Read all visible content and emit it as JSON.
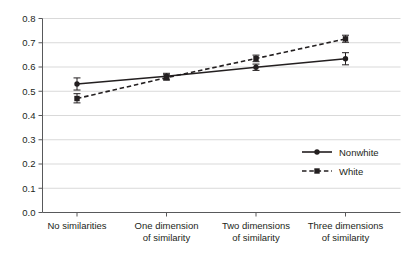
{
  "chart_data": {
    "type": "line",
    "title": "",
    "xlabel": "",
    "ylabel": "",
    "categories": [
      "No similarities",
      "One dimension of similarity",
      "Two dimensions of similarity",
      "Three dimensions of similarity"
    ],
    "category_lines": [
      [
        "No similarities",
        ""
      ],
      [
        "One dimension",
        "of similarity"
      ],
      [
        "Two dimensions",
        "of similarity"
      ],
      [
        "Three dimensions",
        "of similarity"
      ]
    ],
    "ylim": [
      0.0,
      0.8
    ],
    "ytick_labels": [
      "0.0",
      "0.1",
      "0.2",
      "0.3",
      "0.4",
      "0.5",
      "0.6",
      "0.7",
      "0.8"
    ],
    "ytick_values": [
      0.0,
      0.1,
      0.2,
      0.3,
      0.4,
      0.5,
      0.6,
      0.7,
      0.8
    ],
    "grid": true,
    "grid_color": "#d9d9d9",
    "axis_color": "#58595b",
    "legend_position": "lower right",
    "series": [
      {
        "name": "Nonwhite",
        "line_style": "solid",
        "marker": "circle",
        "color": "#231f20",
        "values": [
          0.53,
          0.562,
          0.599,
          0.634
        ],
        "error_low": [
          0.505,
          0.55,
          0.586,
          0.609
        ],
        "error_high": [
          0.555,
          0.574,
          0.612,
          0.659
        ]
      },
      {
        "name": "White",
        "line_style": "dashed",
        "marker": "square",
        "color": "#231f20",
        "values": [
          0.47,
          0.556,
          0.635,
          0.716
        ],
        "error_low": [
          0.452,
          0.546,
          0.622,
          0.702
        ],
        "error_high": [
          0.49,
          0.568,
          0.649,
          0.731
        ]
      }
    ]
  },
  "legend": {
    "items": [
      {
        "label": "Nonwhite",
        "style": "solid-circle"
      },
      {
        "label": "White",
        "style": "dashed-square"
      }
    ]
  }
}
